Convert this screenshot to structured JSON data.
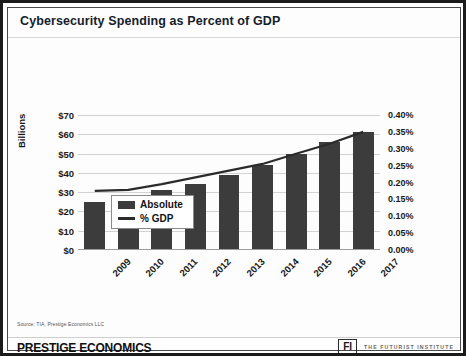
{
  "slide": {
    "title": "Cybersecurity Spending as Percent of GDP",
    "source_note": "Source: TIA, Prestige Economics LLC",
    "footer": {
      "brand": "PRESTIGE ECONOMICS",
      "fi_mark": "FI",
      "fi_name": "THE FUTURIST INSTITUTE"
    }
  },
  "chart_data": {
    "type": "bar",
    "title": "Cybersecurity Spending as Percent of GDP",
    "xlabel": "",
    "ylabel": "Billions",
    "y2label": "",
    "categories": [
      "2009",
      "2010",
      "2011",
      "2012",
      "2013",
      "2014",
      "2015",
      "2016",
      "2017"
    ],
    "series": [
      {
        "name": "Absolute",
        "type": "bar",
        "axis": "left",
        "color": "#3c3c3c",
        "values": [
          25,
          27,
          31,
          34,
          39,
          44,
          50,
          56,
          61
        ]
      },
      {
        "name": "% GDP",
        "type": "line",
        "axis": "right",
        "color": "#2b2b2b",
        "values": [
          0.175,
          0.178,
          0.195,
          0.215,
          0.235,
          0.255,
          0.285,
          0.315,
          0.35
        ]
      }
    ],
    "ylim": [
      0,
      70
    ],
    "yticks": [
      "$0",
      "$10",
      "$20",
      "$30",
      "$40",
      "$50",
      "$60",
      "$70"
    ],
    "ytick_values": [
      0,
      10,
      20,
      30,
      40,
      50,
      60,
      70
    ],
    "y2lim": [
      0,
      0.4
    ],
    "y2ticks": [
      "0.00%",
      "0.05%",
      "0.10%",
      "0.15%",
      "0.20%",
      "0.25%",
      "0.30%",
      "0.35%",
      "0.40%"
    ],
    "y2tick_values": [
      0,
      0.05,
      0.1,
      0.15,
      0.2,
      0.25,
      0.3,
      0.35,
      0.4
    ],
    "grid": true,
    "legend_position": "top-left",
    "legend": [
      "Absolute",
      "% GDP"
    ]
  }
}
